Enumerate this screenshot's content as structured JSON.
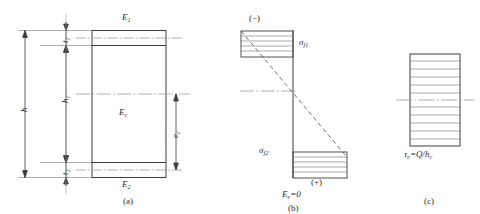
{
  "figure": {
    "background": "#ffffff",
    "line_color": "#3c3c3c",
    "hatch_color": "#6e6e6e",
    "dashed_color": "#555555"
  },
  "panel_a": {
    "tag": "(a)",
    "labels": {
      "face_top_modulus": "E",
      "face_top_modulus_sub": "1",
      "face_bottom_modulus": "E",
      "face_bottom_modulus_sub": "2",
      "core_modulus": "E",
      "core_modulus_sub": "c",
      "thickness_top": "t",
      "thickness_top_sub": "1",
      "thickness_bottom": "t",
      "thickness_bottom_sub": "2",
      "total_height": "h",
      "core_height": "h",
      "core_height_sub": "c",
      "centroid_offset": "e",
      "centroid_offset_sub": "c"
    }
  },
  "panel_b": {
    "tag": "(b)",
    "labels": {
      "sign_top": "(−)",
      "sign_bottom": "(+)",
      "stress_top": "σ",
      "stress_top_sub": "f1",
      "stress_bottom": "σ",
      "stress_bottom_sub": "f2",
      "assumption": "E",
      "assumption_sub": "c",
      "assumption_rest": "=0"
    }
  },
  "panel_c": {
    "tag": "(c)",
    "labels": {
      "shear_stress": "τ",
      "shear_stress_sub": "c",
      "shear_formula": "=Q/h",
      "shear_formula_sub": "c"
    },
    "hatch_line_count": 11
  }
}
